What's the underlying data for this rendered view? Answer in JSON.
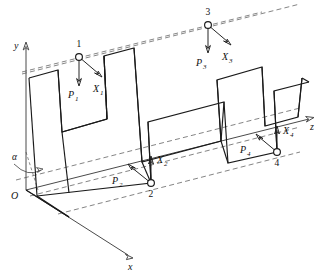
{
  "figure": {
    "type": "engineering-diagram"
  },
  "axes": {
    "y": {
      "label": "y",
      "arrow": "up"
    },
    "z": {
      "label": "z",
      "arrow": "right"
    },
    "x": {
      "label": "x",
      "arrow": "down-right"
    },
    "origin": {
      "label": "O"
    },
    "angle": {
      "label": "α"
    }
  },
  "nodes": [
    {
      "id": "1",
      "number_label": "1",
      "force_label": "P",
      "force_sub": "1",
      "reaction_label": "X",
      "reaction_sub": "1",
      "force_direction": "down",
      "reaction_direction": "down-right"
    },
    {
      "id": "2",
      "number_label": "2",
      "force_label": "P",
      "force_sub": "2",
      "reaction_label": "X",
      "reaction_sub": "2",
      "force_direction": "up-left",
      "reaction_direction": "up"
    },
    {
      "id": "3",
      "number_label": "3",
      "force_label": "P",
      "force_sub": "3",
      "reaction_label": "X",
      "reaction_sub": "3",
      "force_direction": "down",
      "reaction_direction": "down-right"
    },
    {
      "id": "4",
      "number_label": "4",
      "force_label": "P",
      "force_sub": "4",
      "reaction_label": "X",
      "reaction_sub": "4",
      "force_direction": "up-left",
      "reaction_direction": "up"
    }
  ],
  "colors": {
    "outline": "#1a1a1a",
    "axis": "#4a4a4a",
    "dashed": "#6e6e6e",
    "background": "#ffffff"
  }
}
